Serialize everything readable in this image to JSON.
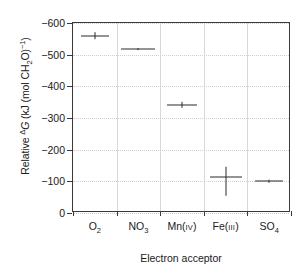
{
  "chart_data": {
    "type": "scatter",
    "title": "",
    "xlabel": "Electron acceptor",
    "ylabel": "Relative ΔG (kJ (mol CH2O)⁻¹)",
    "ylabel_parts": {
      "prefix": "Relative ",
      "delta": "Δ",
      "symbol": "G",
      "units_open": " (kJ (mol CH",
      "units_sub": "2",
      "units_mid": "O)",
      "units_sup": "−1",
      "units_close": ")"
    },
    "categories": [
      "O2",
      "NO3",
      "Mn(iv)",
      "Fe(iii)",
      "SO4"
    ],
    "category_labels": [
      {
        "base": "O",
        "sub": "2",
        "roman": ""
      },
      {
        "base": "NO",
        "sub": "3",
        "roman": ""
      },
      {
        "base": "Mn(",
        "sub": "",
        "roman": "iv",
        "tail": ")"
      },
      {
        "base": "Fe(",
        "sub": "",
        "roman": "iii",
        "tail": ")"
      },
      {
        "base": "SO",
        "sub": "4",
        "roman": ""
      }
    ],
    "values": [
      -560,
      -517,
      -342,
      -113,
      -100
    ],
    "error_low": [
      -572,
      -520,
      -352,
      -145,
      -104
    ],
    "error_high": [
      -548,
      -514,
      -332,
      -55,
      -96
    ],
    "ylim": [
      -600,
      0
    ],
    "yticks": [
      -600,
      -500,
      -400,
      -300,
      -200,
      -100,
      0
    ],
    "ytick_labels": [
      "−600",
      "−500",
      "−400",
      "−300",
      "−200",
      "−100",
      "0"
    ],
    "y_axis_inverted": true,
    "grid": {
      "horizontal": true,
      "vertical": true
    },
    "legend": null,
    "marker_half_width_px": [
      14,
      17,
      15,
      16,
      14
    ],
    "colors": {
      "marker": "#2a2a2a",
      "axis": "#3a3a3a",
      "grid_h": "#cfcfcf",
      "grid_v": "#d8d8d8",
      "background": "#ffffff",
      "text": "#1a1a1a"
    }
  }
}
